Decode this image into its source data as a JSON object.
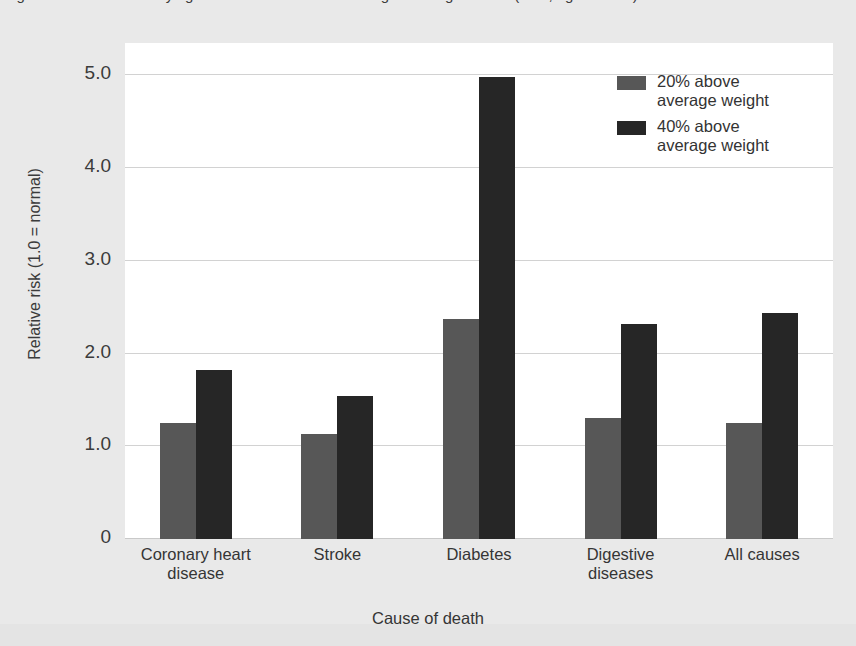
{
  "caption": {
    "text": "Figure: Relative risk of dying from selected causes among overweight adults (men, aged 30-64)"
  },
  "chart_data": {
    "type": "bar",
    "title": "",
    "xlabel": "Cause of death",
    "ylabel": "Relative risk (1.0 = normal)",
    "categories": [
      "Coronary heart\ndisease",
      "Stroke",
      "Diabetes",
      "Digestive\ndiseases",
      "All causes"
    ],
    "series": [
      {
        "name": "20% above\naverage weight",
        "color": "#575757",
        "values": [
          1.25,
          1.13,
          2.37,
          1.31,
          1.25
        ]
      },
      {
        "name": "40% above\naverage weight",
        "color": "#262626",
        "values": [
          1.82,
          1.54,
          4.98,
          2.32,
          2.44
        ]
      }
    ],
    "ylim": [
      0,
      5.35
    ],
    "yticks": [
      0,
      1.0,
      2.0,
      3.0,
      4.0,
      5.0
    ],
    "ytick_labels": [
      "0",
      "1.0",
      "2.0",
      "3.0",
      "4.0",
      "5.0"
    ],
    "grid": true,
    "legend_position": "top-right"
  },
  "axis": {
    "y_title": "Relative risk (1.0 = normal)",
    "x_title": "Cause of death"
  },
  "legend": {
    "items": [
      {
        "label": "20% above\naverage weight",
        "color": "#575757"
      },
      {
        "label": "40% above\naverage weight",
        "color": "#262626"
      }
    ]
  },
  "colors": {
    "page_background": "#e9e9e9",
    "plot_background": "#ffffff",
    "gridline": "#d2d2d2",
    "series_20": "#575757",
    "series_40": "#262626",
    "text": "#353535"
  }
}
